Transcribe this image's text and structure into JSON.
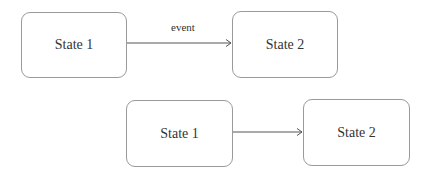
{
  "diagram": {
    "top": {
      "source": {
        "label": "State 1"
      },
      "target": {
        "label": "State 2"
      },
      "transition": {
        "label": "event"
      }
    },
    "bottom": {
      "source": {
        "label": "State 1"
      },
      "target": {
        "label": "State 2"
      }
    }
  },
  "colors": {
    "stroke": "#9a9a9a",
    "arrow": "#444444",
    "text": "#333333"
  }
}
